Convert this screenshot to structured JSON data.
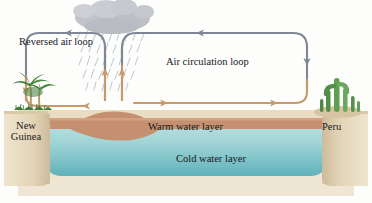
{
  "figure": {
    "labels": {
      "reversed_air_loop": "Reversed air loop",
      "air_circulation_loop": "Air circulation loop",
      "warm_water_layer": "Warm water layer",
      "cold_water_layer": "Cold water layer",
      "new_guinea": "New Guinea",
      "peru": "Peru"
    },
    "colors": {
      "air_arrow_upper": "#7b8496",
      "air_arrow_lower": "#c8996b",
      "cloud": "#b9bcc2",
      "rain": "#b9c3cf",
      "land": "#e3d5bb",
      "land_shadow": "#cdbb9c",
      "warm_water": "#c8906f",
      "cold_water_top": "#b6ddde",
      "cold_water_bottom": "#63b5bc",
      "palm_green": "#3f7d3a",
      "cactus_green": "#5f9e53",
      "text": "#17171c",
      "background": "#fdfdfb"
    },
    "elements": [
      {
        "name": "cloud",
        "kind": "weather",
        "position": "top-center-left"
      },
      {
        "name": "rainfall",
        "kind": "weather",
        "position": "below-cloud"
      },
      {
        "name": "palm-tree",
        "kind": "vegetation",
        "position": "left-coast"
      },
      {
        "name": "cactus",
        "kind": "vegetation",
        "position": "right-coast"
      },
      {
        "name": "reversed-air-loop-arrow",
        "kind": "arrow",
        "direction": "counterclockwise"
      },
      {
        "name": "air-circulation-loop-arrow",
        "kind": "arrow",
        "direction": "clockwise"
      }
    ]
  }
}
